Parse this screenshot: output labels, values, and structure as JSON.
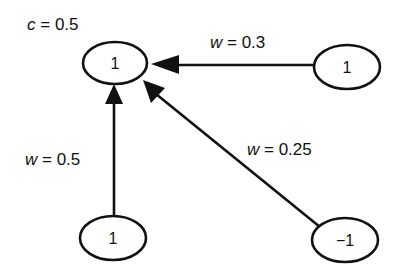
{
  "diagram": {
    "type": "neural-network-node",
    "threshold_label": {
      "var": "c",
      "eq": " = ",
      "value": "0.5"
    },
    "nodes": [
      {
        "id": "output",
        "value": "1"
      },
      {
        "id": "input-right",
        "value": "1"
      },
      {
        "id": "input-bottom-left",
        "value": "1"
      },
      {
        "id": "input-bottom-right",
        "value": "−1"
      }
    ],
    "edges": [
      {
        "from": "input-right",
        "to": "output",
        "weight_var": "w",
        "eq": " = ",
        "weight": "0.3"
      },
      {
        "from": "input-bottom-left",
        "to": "output",
        "weight_var": "w",
        "eq": " = ",
        "weight": "0.5"
      },
      {
        "from": "input-bottom-right",
        "to": "output",
        "weight_var": "w",
        "eq": " = ",
        "weight": "0.25"
      }
    ],
    "colors": {
      "stroke": "#111111",
      "background": "#ffffff"
    }
  }
}
